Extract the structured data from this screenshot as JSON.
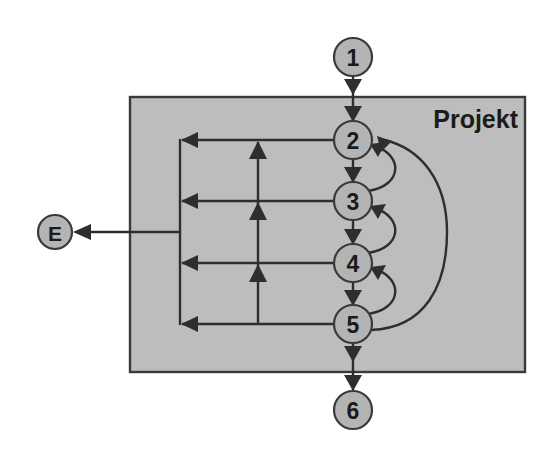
{
  "diagram": {
    "title": "Projekt",
    "kind": "flow-diagram",
    "canvas": {
      "width": 550,
      "height": 456,
      "background": "#ffffff"
    },
    "container": {
      "label": "Projekt",
      "fill": "#bdbdbd",
      "stroke": "#3a3a3a",
      "x": 130,
      "y": 97,
      "width": 395,
      "height": 275,
      "label_x": 518,
      "label_y": 125
    },
    "node_style": {
      "fill": "#b4b4b4",
      "stroke": "#3a3a3a",
      "stroke_width": 2.2,
      "radius": 19,
      "small_radius": 17,
      "text_color": "#1b1b1b"
    },
    "nodes": [
      {
        "id": "n1",
        "label": "1",
        "cx": 353,
        "cy": 57,
        "r": 19,
        "inside_container": false
      },
      {
        "id": "n2",
        "label": "2",
        "cx": 353,
        "cy": 140,
        "r": 19,
        "inside_container": true
      },
      {
        "id": "n3",
        "label": "3",
        "cx": 353,
        "cy": 201,
        "r": 19,
        "inside_container": true
      },
      {
        "id": "n4",
        "label": "4",
        "cx": 353,
        "cy": 263,
        "r": 19,
        "inside_container": true
      },
      {
        "id": "n5",
        "label": "5",
        "cx": 353,
        "cy": 324,
        "r": 19,
        "inside_container": true
      },
      {
        "id": "n6",
        "label": "6",
        "cx": 353,
        "cy": 410,
        "r": 19,
        "inside_container": false
      },
      {
        "id": "nE",
        "label": "E",
        "cx": 55,
        "cy": 232,
        "r": 17,
        "inside_container": false
      }
    ],
    "edges": [
      {
        "id": "e1-2",
        "from": "1",
        "to": "2",
        "kind": "straight-down"
      },
      {
        "id": "e2-3",
        "from": "2",
        "to": "3",
        "kind": "straight-down"
      },
      {
        "id": "e3-4",
        "from": "3",
        "to": "4",
        "kind": "straight-down"
      },
      {
        "id": "e4-5",
        "from": "4",
        "to": "5",
        "kind": "straight-down"
      },
      {
        "id": "e5-6",
        "from": "5",
        "to": "6",
        "kind": "straight-down"
      },
      {
        "id": "e3-2",
        "from": "3",
        "to": "2",
        "kind": "arc-back-right"
      },
      {
        "id": "e4-3",
        "from": "4",
        "to": "3",
        "kind": "arc-back-right"
      },
      {
        "id": "e5-4",
        "from": "5",
        "to": "4",
        "kind": "arc-back-right"
      },
      {
        "id": "e5-2",
        "from": "5",
        "to": "2",
        "kind": "arc-back-right-long"
      },
      {
        "id": "e2-bus",
        "from": "2",
        "to": "bus",
        "kind": "horizontal-left"
      },
      {
        "id": "e3-bus",
        "from": "3",
        "to": "bus",
        "kind": "horizontal-left"
      },
      {
        "id": "e4-bus",
        "from": "4",
        "to": "bus",
        "kind": "horizontal-left"
      },
      {
        "id": "e5-bus",
        "from": "5",
        "to": "bus",
        "kind": "horizontal-left"
      },
      {
        "id": "e-bus-E",
        "from": "bus",
        "to": "E",
        "kind": "horizontal-left-exit"
      },
      {
        "id": "e-riser",
        "from": "row5",
        "to": "row2",
        "kind": "vertical-up-riser"
      }
    ],
    "bus": {
      "x": 180,
      "top_y": 140,
      "bottom_y": 324,
      "exit_y": 232
    },
    "riser": {
      "x": 258,
      "top_y": 140,
      "bottom_y": 324,
      "arrow_rows": [
        140,
        201,
        263
      ]
    },
    "arcs": {
      "short_peak_x": 402,
      "long_peak_x": 443
    }
  }
}
